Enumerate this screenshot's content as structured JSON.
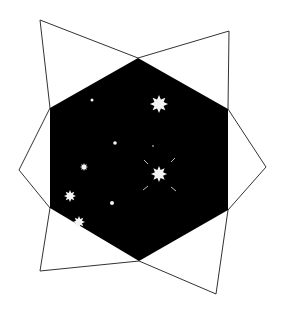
{
  "figure": {
    "colors": {
      "background": "#ffffff",
      "hexagon_fill": "#000000",
      "outline": "#333333",
      "star": "#f4f4f4"
    },
    "hexagon": {
      "points": "138,58 228,109 228,210 139,261 50,208 50,108"
    },
    "flaps": [
      {
        "name": "flap-top-left",
        "points": "50,108 40,20 138,58"
      },
      {
        "name": "flap-top-right",
        "points": "138,58 229,31 228,109"
      },
      {
        "name": "flap-right",
        "points": "228,109 266,167 228,210"
      },
      {
        "name": "flap-bottom-right",
        "points": "228,210 216,294 139,261"
      },
      {
        "name": "flap-bottom-left",
        "points": "139,261 40,271 50,208"
      },
      {
        "name": "flap-left",
        "points": "50,208 19,170 50,108"
      }
    ],
    "stars": [
      {
        "name": "star-large-top",
        "cx": 159,
        "cy": 104,
        "r": 9
      },
      {
        "name": "star-large-center",
        "cx": 159,
        "cy": 174,
        "r": 8
      },
      {
        "name": "star-left",
        "cx": 70,
        "cy": 196,
        "r": 6
      },
      {
        "name": "star-bottom-left",
        "cx": 79,
        "cy": 222,
        "r": 6
      },
      {
        "name": "star-small-left",
        "cx": 84,
        "cy": 167,
        "r": 4
      }
    ],
    "dots": [
      {
        "name": "dot-top-left",
        "cx": 92,
        "cy": 100,
        "r": 1.5
      },
      {
        "name": "dot-middle",
        "cx": 115,
        "cy": 143,
        "r": 1.8
      },
      {
        "name": "dot-lower",
        "cx": 112,
        "cy": 203,
        "r": 2
      },
      {
        "name": "dot-faint",
        "cx": 153,
        "cy": 146,
        "r": 0.8
      }
    ],
    "rays": [
      {
        "x1": 144,
        "y1": 160,
        "x2": 148,
        "y2": 164
      },
      {
        "x1": 175,
        "y1": 158,
        "x2": 171,
        "y2": 162
      },
      {
        "x1": 143,
        "y1": 190,
        "x2": 148,
        "y2": 186
      },
      {
        "x1": 171,
        "y1": 187,
        "x2": 176,
        "y2": 191
      }
    ]
  }
}
